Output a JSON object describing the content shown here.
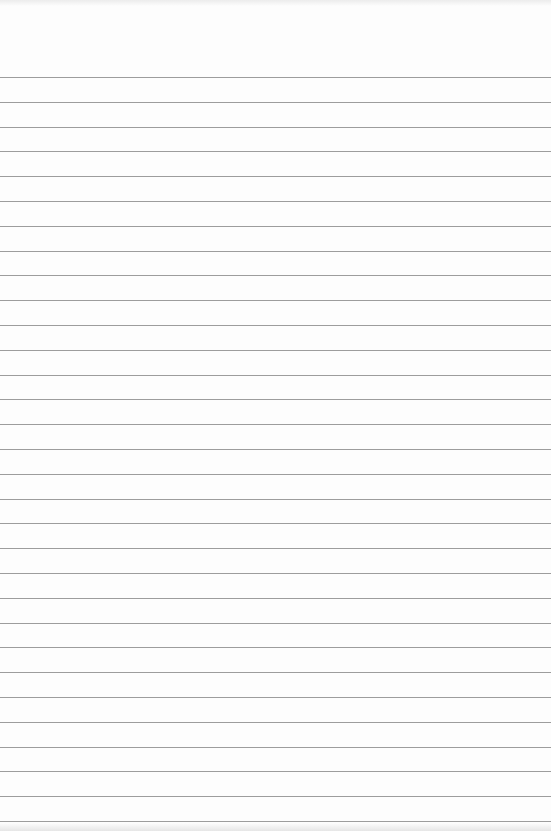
{
  "page": {
    "type": "lined-paper",
    "background_color": "#fdfdfd",
    "line_color": "#9d9d9d",
    "first_line_y": 77,
    "line_spacing": 24.8,
    "line_count": 31
  }
}
